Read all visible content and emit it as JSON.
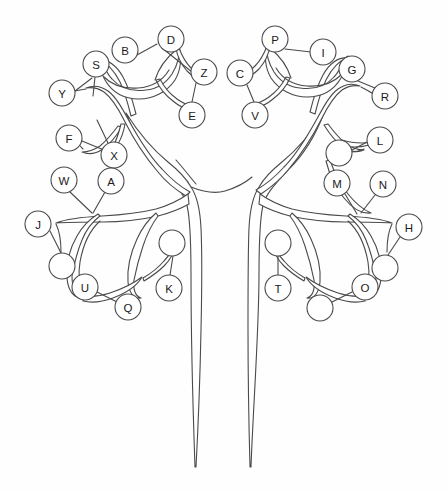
{
  "figure": {
    "background_color": "#fefefe",
    "stroke_color": "#4a4a4a",
    "node_fill_color": "#ffffff",
    "label_color": "#1a1a1a",
    "width": 447,
    "height": 492,
    "node_radius": 13,
    "node_count": 32,
    "lettered_node_count": 26,
    "empty_node_count": 6
  },
  "nodes": [
    {
      "id": "node-Y",
      "label": "Y",
      "cx": 62,
      "cy": 93,
      "r": 13,
      "empty": false,
      "branch": "left-upper"
    },
    {
      "id": "node-S",
      "label": "S",
      "cx": 96,
      "cy": 64,
      "r": 13,
      "empty": false,
      "branch": "left-upper"
    },
    {
      "id": "node-B",
      "label": "B",
      "cx": 125,
      "cy": 50,
      "r": 13,
      "empty": false,
      "branch": "left-upper"
    },
    {
      "id": "node-D",
      "label": "D",
      "cx": 171,
      "cy": 39,
      "r": 13,
      "empty": false,
      "branch": "left-upper"
    },
    {
      "id": "node-Z",
      "label": "Z",
      "cx": 204,
      "cy": 72,
      "r": 13,
      "empty": false,
      "branch": "left-upper"
    },
    {
      "id": "node-E",
      "label": "E",
      "cx": 192,
      "cy": 115,
      "r": 13,
      "empty": false,
      "branch": "left-upper"
    },
    {
      "id": "node-F",
      "label": "F",
      "cx": 69,
      "cy": 138,
      "r": 13,
      "empty": false,
      "branch": "left-upper"
    },
    {
      "id": "node-X",
      "label": "X",
      "cx": 114,
      "cy": 155,
      "r": 13,
      "empty": false,
      "branch": "left-upper"
    },
    {
      "id": "node-W",
      "label": "W",
      "cx": 64,
      "cy": 180,
      "r": 13,
      "empty": false,
      "branch": "left-upper"
    },
    {
      "id": "node-A",
      "label": "A",
      "cx": 111,
      "cy": 181,
      "r": 13,
      "empty": false,
      "branch": "left-upper"
    },
    {
      "id": "node-J",
      "label": "J",
      "cx": 38,
      "cy": 224,
      "r": 13,
      "empty": false,
      "branch": "left-lower"
    },
    {
      "id": "node-L1",
      "label": "",
      "cx": 62,
      "cy": 266,
      "r": 13,
      "empty": true,
      "branch": "left-lower"
    },
    {
      "id": "node-U",
      "label": "U",
      "cx": 85,
      "cy": 287,
      "r": 13,
      "empty": false,
      "branch": "left-lower"
    },
    {
      "id": "node-Q",
      "label": "Q",
      "cx": 128,
      "cy": 307,
      "r": 13,
      "empty": false,
      "branch": "left-lower"
    },
    {
      "id": "node-L2",
      "label": "",
      "cx": 172,
      "cy": 243,
      "r": 13,
      "empty": true,
      "branch": "left-lower"
    },
    {
      "id": "node-K",
      "label": "K",
      "cx": 169,
      "cy": 288,
      "r": 13,
      "empty": false,
      "branch": "left-lower"
    },
    {
      "id": "node-C",
      "label": "C",
      "cx": 240,
      "cy": 73,
      "r": 13,
      "empty": false,
      "branch": "right-upper"
    },
    {
      "id": "node-V",
      "label": "V",
      "cx": 255,
      "cy": 115,
      "r": 13,
      "empty": false,
      "branch": "right-upper"
    },
    {
      "id": "node-P",
      "label": "P",
      "cx": 275,
      "cy": 39,
      "r": 13,
      "empty": false,
      "branch": "right-upper"
    },
    {
      "id": "node-I",
      "label": "I",
      "cx": 323,
      "cy": 52,
      "r": 13,
      "empty": false,
      "branch": "right-upper"
    },
    {
      "id": "node-G",
      "label": "G",
      "cx": 352,
      "cy": 69,
      "r": 13,
      "empty": false,
      "branch": "right-upper"
    },
    {
      "id": "node-R",
      "label": "R",
      "cx": 385,
      "cy": 96,
      "r": 13,
      "empty": false,
      "branch": "right-upper"
    },
    {
      "id": "node-L",
      "label": "L",
      "cx": 380,
      "cy": 140,
      "r": 13,
      "empty": false,
      "branch": "right-upper"
    },
    {
      "id": "node-R1",
      "label": "",
      "cx": 339,
      "cy": 153,
      "r": 13,
      "empty": true,
      "branch": "right-upper"
    },
    {
      "id": "node-M",
      "label": "M",
      "cx": 337,
      "cy": 183,
      "r": 13,
      "empty": false,
      "branch": "right-upper"
    },
    {
      "id": "node-N",
      "label": "N",
      "cx": 383,
      "cy": 184,
      "r": 13,
      "empty": false,
      "branch": "right-upper"
    },
    {
      "id": "node-H",
      "label": "H",
      "cx": 409,
      "cy": 227,
      "r": 13,
      "empty": false,
      "branch": "right-lower"
    },
    {
      "id": "node-R2",
      "label": "",
      "cx": 385,
      "cy": 268,
      "r": 13,
      "empty": true,
      "branch": "right-lower"
    },
    {
      "id": "node-O",
      "label": "O",
      "cx": 365,
      "cy": 287,
      "r": 13,
      "empty": false,
      "branch": "right-lower"
    },
    {
      "id": "node-R3",
      "label": "",
      "cx": 320,
      "cy": 308,
      "r": 13,
      "empty": true,
      "branch": "right-lower"
    },
    {
      "id": "node-R4",
      "label": "",
      "cx": 278,
      "cy": 243,
      "r": 13,
      "empty": true,
      "branch": "right-lower"
    },
    {
      "id": "node-T",
      "label": "T",
      "cx": 278,
      "cy": 288,
      "r": 13,
      "empty": false,
      "branch": "right-lower"
    }
  ],
  "twigs": [
    {
      "id": "twig-Y",
      "d": "M 75 91 L 92 78"
    },
    {
      "id": "twig-S",
      "d": "M 95 77 L 93 96"
    },
    {
      "id": "twig-B",
      "d": "M 137 55 L 157 44"
    },
    {
      "id": "twig-Z1",
      "d": "M 196 83 L 192 102"
    },
    {
      "id": "twig-Z2",
      "d": "M 192 72 L 162 48"
    },
    {
      "id": "twig-F",
      "d": "M 82 141 L 104 150"
    },
    {
      "id": "twig-X",
      "d": "M 108 143 L 97 120"
    },
    {
      "id": "twig-W",
      "d": "M 70 192 L 92 213"
    },
    {
      "id": "twig-A",
      "d": "M 105 192 L 93 213"
    },
    {
      "id": "twig-J",
      "d": "M 50 231 L 61 253"
    },
    {
      "id": "twig-U",
      "d": "M 97 292 L 117 302"
    },
    {
      "id": "twig-K",
      "d": "M 170 275 L 173 256"
    },
    {
      "id": "twig-C",
      "d": "M 247 85 L 254 102"
    },
    {
      "id": "twig-P",
      "d": "M 285 49 L 311 52"
    },
    {
      "id": "twig-G",
      "d": "M 358 81 L 375 88"
    },
    {
      "id": "twig-L",
      "d": "M 367 142 L 352 150"
    },
    {
      "id": "twig-M",
      "d": "M 345 194 L 357 214"
    },
    {
      "id": "twig-N",
      "d": "M 375 195 L 361 213"
    },
    {
      "id": "twig-H",
      "d": "M 400 237 L 388 255"
    },
    {
      "id": "twig-O",
      "d": "M 352 292 L 332 302"
    },
    {
      "id": "twig-T",
      "d": "M 278 275 L 278 256"
    }
  ],
  "branches": [
    {
      "id": "trunk",
      "d": "M 197 467 C 199 400 201 300 200 235 C 199 210 196 197 190 188 C 200 190 210 192 221 197 C 230 205 235 230 238 280 C 242 360 245 420 247 467 C 243 400 240 330 237 280 C 234 235 228 205 220 197 C 212 194 205 192 197 192 Z"
    },
    {
      "id": "branch-left-main",
      "d": "M 192 188 C 176 184 163 178 152 170 C 136 157 124 140 112 122 C 120 135 131 152 146 166 C 158 178 174 186 192 192 Z"
    },
    {
      "id": "branch-right-main",
      "d": "M 222 190 C 240 185 256 177 268 165 C 283 150 294 132 302 118 C 292 138 280 157 264 170 C 252 180 238 186 222 194 Z"
    }
  ],
  "accessibility": {
    "alt_text": "Black and white line drawing of a tree whose branches end in circles labeled with letters A through Z plus six blank circles"
  }
}
